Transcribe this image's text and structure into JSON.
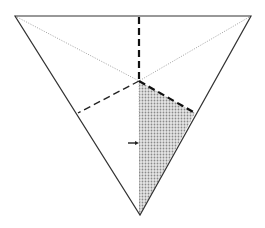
{
  "diagram": {
    "points": {
      "top_left": [
        15,
        16
      ],
      "top_right": [
        251,
        16
      ],
      "bottom": [
        140,
        215
      ],
      "center": [
        139,
        81
      ],
      "right_edge_mid": [
        195,
        113
      ],
      "left_edge_mid": [
        78,
        113
      ],
      "top_edge_mid": [
        139,
        16
      ]
    },
    "colors": {
      "stroke": "#333333",
      "dotted": "#888888",
      "shade": "#c8c8c8",
      "background": "#ffffff"
    },
    "arrow": {
      "from": [
        128,
        143
      ],
      "to": [
        138,
        143
      ],
      "direction": "right"
    }
  }
}
